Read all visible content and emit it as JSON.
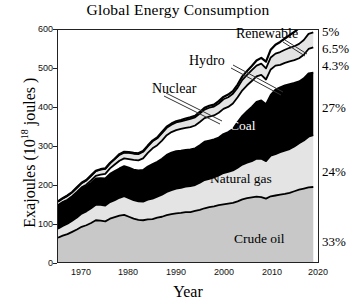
{
  "chart_data": {
    "type": "area",
    "title": "Global Energy Consumption",
    "xlabel": "Year",
    "ylabel": "Exajoules (10^18 joules)",
    "ylabel_prefix": "Exajoules (10",
    "ylabel_exponent": "18",
    "ylabel_suffix": " joules )",
    "xlim": [
      1965,
      2020
    ],
    "ylim": [
      0,
      600
    ],
    "xticks": [
      1970,
      1980,
      1990,
      2000,
      2010,
      2020
    ],
    "yticks": [
      0,
      100,
      200,
      300,
      400,
      500,
      600
    ],
    "grid": false,
    "legend": "in-plot annotations with leader lines",
    "stack_order_bottom_to_top": [
      "Crude oil",
      "Natural gas",
      "Coal",
      "Nuclear",
      "Hydro",
      "Renewable"
    ],
    "x": [
      1965,
      1966,
      1967,
      1968,
      1969,
      1970,
      1971,
      1972,
      1973,
      1974,
      1975,
      1976,
      1977,
      1978,
      1979,
      1980,
      1981,
      1982,
      1983,
      1984,
      1985,
      1986,
      1987,
      1988,
      1989,
      1990,
      1991,
      1992,
      1993,
      1994,
      1995,
      1996,
      1997,
      1998,
      1999,
      2000,
      2001,
      2002,
      2003,
      2004,
      2005,
      2006,
      2007,
      2008,
      2009,
      2010,
      2011,
      2012,
      2013,
      2014,
      2015,
      2016,
      2017,
      2018,
      2019
    ],
    "series": [
      {
        "name": "Crude oil",
        "share_2019": "33%",
        "color": "#c8c8c8",
        "label_color": "#000000",
        "values": [
          63,
          68,
          72,
          78,
          84,
          91,
          95,
          101,
          108,
          107,
          105,
          112,
          116,
          120,
          122,
          117,
          112,
          109,
          108,
          110,
          111,
          115,
          117,
          121,
          124,
          126,
          127,
          129,
          129,
          132,
          135,
          139,
          142,
          144,
          147,
          149,
          151,
          153,
          157,
          162,
          165,
          167,
          169,
          168,
          164,
          170,
          172,
          174,
          176,
          179,
          183,
          187,
          190,
          193,
          194
        ]
      },
      {
        "name": "Natural gas",
        "share_2019": "24%",
        "color": "#e4e4e4",
        "label_color": "#000000",
        "values": [
          23,
          25,
          27,
          29,
          31,
          34,
          36,
          38,
          40,
          41,
          41,
          43,
          44,
          46,
          48,
          48,
          48,
          48,
          48,
          51,
          53,
          54,
          57,
          60,
          62,
          64,
          65,
          66,
          67,
          67,
          70,
          73,
          73,
          75,
          77,
          81,
          82,
          84,
          87,
          90,
          92,
          94,
          98,
          99,
          97,
          105,
          107,
          110,
          112,
          113,
          116,
          120,
          124,
          131,
          134
        ]
      },
      {
        "name": "Coal",
        "share_2019": "27%",
        "color": "#000000",
        "label_color": "#ffffff",
        "values": [
          60,
          61,
          60,
          61,
          63,
          65,
          65,
          66,
          68,
          69,
          70,
          73,
          75,
          76,
          78,
          79,
          79,
          80,
          82,
          86,
          89,
          90,
          93,
          96,
          97,
          97,
          96,
          95,
          95,
          95,
          97,
          99,
          99,
          98,
          98,
          101,
          103,
          107,
          118,
          126,
          133,
          140,
          147,
          151,
          147,
          157,
          167,
          168,
          169,
          168,
          164,
          160,
          161,
          164,
          162
        ]
      },
      {
        "name": "Nuclear",
        "share_2019": "4.3%",
        "color": "#ffffff",
        "label_color": "#000000",
        "values": [
          1,
          1,
          2,
          2,
          3,
          3,
          4,
          6,
          7,
          9,
          12,
          14,
          17,
          20,
          20,
          22,
          25,
          26,
          30,
          35,
          41,
          43,
          47,
          51,
          53,
          54,
          56,
          57,
          58,
          59,
          60,
          61,
          62,
          62,
          64,
          65,
          65,
          66,
          64,
          66,
          67,
          67,
          66,
          66,
          64,
          66,
          62,
          58,
          58,
          59,
          59,
          60,
          61,
          63,
          65
        ]
      },
      {
        "name": "Hydro",
        "share_2019": "6.5%",
        "color": "#e4e4e4",
        "label_color": "#000000",
        "values": [
          9,
          9,
          10,
          10,
          11,
          11,
          11,
          12,
          12,
          13,
          13,
          13,
          14,
          15,
          15,
          16,
          16,
          16,
          17,
          17,
          18,
          18,
          19,
          19,
          19,
          20,
          20,
          20,
          21,
          21,
          22,
          22,
          23,
          23,
          24,
          25,
          25,
          25,
          25,
          27,
          27,
          28,
          28,
          29,
          29,
          31,
          31,
          33,
          34,
          35,
          36,
          37,
          38,
          39,
          39
        ]
      },
      {
        "name": "Renewable",
        "share_2019": "5%",
        "color": "#ffffff",
        "label_color": "#000000",
        "values": [
          1,
          1,
          1,
          1,
          1,
          1,
          1,
          1,
          1,
          1,
          1,
          1,
          1,
          2,
          2,
          2,
          2,
          2,
          2,
          2,
          2,
          2,
          3,
          3,
          3,
          3,
          3,
          4,
          4,
          4,
          4,
          5,
          5,
          5,
          6,
          6,
          7,
          7,
          8,
          9,
          10,
          11,
          13,
          15,
          17,
          20,
          23,
          26,
          29,
          33,
          37,
          41,
          46,
          52,
          58
        ]
      }
    ],
    "annotations": [
      {
        "text": "Renewable",
        "kind": "leader"
      },
      {
        "text": "Hydro",
        "kind": "leader"
      },
      {
        "text": "Nuclear",
        "kind": "leader"
      },
      {
        "text": "Coal",
        "kind": "inside"
      },
      {
        "text": "Natural gas",
        "kind": "inside"
      },
      {
        "text": "Crude oil",
        "kind": "inside"
      }
    ],
    "right_percent_labels": [
      "5%",
      "6.5%",
      "4.3%",
      "27%",
      "24%",
      "33%"
    ]
  }
}
